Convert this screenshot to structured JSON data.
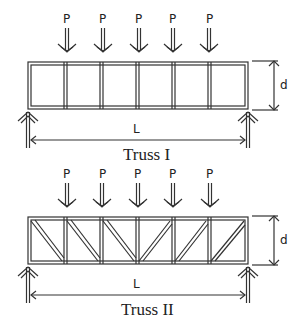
{
  "trusses": [
    {
      "caption": "Truss I",
      "load_label": "P",
      "depth_label": "d",
      "span_label": "L",
      "panels": 6,
      "diagonals": false
    },
    {
      "caption": "Truss II",
      "load_label": "P",
      "depth_label": "d",
      "span_label": "L",
      "panels": 6,
      "diagonals": true
    }
  ],
  "loads": [
    "P",
    "P",
    "P",
    "P",
    "P"
  ]
}
